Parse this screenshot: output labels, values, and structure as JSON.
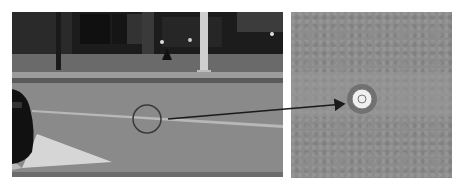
{
  "figure": {
    "panels": [
      {
        "id": "left",
        "description": "Street scene photo with road lane marking; a circle highlights a road stud location",
        "colors": {
          "road": "#8a8a8a",
          "storefront": "#1e1e1e",
          "sidewalk": "#6e6e6e",
          "curb": "#9a9a9a",
          "marking": "#d8d8d8",
          "car": "#111111"
        }
      },
      {
        "id": "right",
        "description": "Close-up of asphalt with a round reflective road stud at center",
        "colors": {
          "asphalt": "#8c8c8c",
          "stud": "#f0f0f0",
          "stud_ring": "#555555"
        }
      }
    ],
    "annotations": {
      "circle": {
        "cx": 147,
        "cy": 119,
        "r": 14,
        "color": "#3a3a3a"
      },
      "arrow": {
        "x1": 168,
        "y1": 119,
        "x2": 346,
        "y2": 104,
        "color": "#1a1a1a"
      }
    }
  }
}
